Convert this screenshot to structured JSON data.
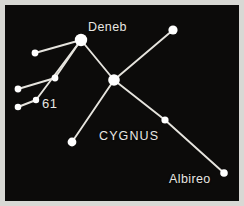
{
  "figure": {
    "kind": "star-chart",
    "subject": "CYGNUS",
    "background_color": "#0c0b0a",
    "border_color": "#d8d8d4",
    "star_color": "#ffffff",
    "line_color": "#e6e4de",
    "label_color": "#e9e7e2"
  },
  "labels": {
    "deneb": "Deneb",
    "sixty_one": "61",
    "cygnus": "CYGNUS",
    "albireo": "Albireo"
  },
  "chart_data": {
    "type": "scatter",
    "title": "CYGNUS",
    "xlabel": "",
    "ylabel": "",
    "xlim": [
      0,
      244
    ],
    "ylim": [
      0,
      206
    ],
    "grid": false,
    "legend": "none",
    "annotations": [
      "Deneb",
      "61",
      "CYGNUS",
      "Albireo"
    ],
    "stars": [
      {
        "id": "deneb",
        "label": "Deneb",
        "x": 81,
        "y": 40,
        "r": 6.2
      },
      {
        "id": "sadr",
        "label": "",
        "x": 114,
        "y": 80,
        "r": 5.8
      },
      {
        "id": "top-right",
        "label": "",
        "x": 173,
        "y": 30,
        "r": 4.6
      },
      {
        "id": "upper-left",
        "label": "",
        "x": 35,
        "y": 53,
        "r": 3.4
      },
      {
        "id": "wing-junction",
        "label": "",
        "x": 55,
        "y": 78,
        "r": 3.4
      },
      {
        "id": "left-mid",
        "label": "",
        "x": 18,
        "y": 89,
        "r": 3.4
      },
      {
        "id": "sixty-one",
        "label": "61",
        "x": 36,
        "y": 100,
        "r": 3.2
      },
      {
        "id": "lower-left",
        "label": "",
        "x": 18,
        "y": 107,
        "r": 3.3
      },
      {
        "id": "tail-bottom",
        "label": "",
        "x": 72,
        "y": 142,
        "r": 4.4
      },
      {
        "id": "mid-right",
        "label": "",
        "x": 165,
        "y": 120,
        "r": 3.6
      },
      {
        "id": "albireo",
        "label": "Albireo",
        "x": 224,
        "y": 173,
        "r": 3.8
      }
    ],
    "lines": [
      {
        "from": "upper-left",
        "to": "deneb"
      },
      {
        "from": "left-mid",
        "to": "wing-junction"
      },
      {
        "from": "wing-junction",
        "to": "deneb"
      },
      {
        "from": "lower-left",
        "to": "sixty-one"
      },
      {
        "from": "sixty-one",
        "to": "deneb"
      },
      {
        "from": "deneb",
        "to": "sadr"
      },
      {
        "from": "sadr",
        "to": "top-right"
      },
      {
        "from": "sadr",
        "to": "tail-bottom"
      },
      {
        "from": "sadr",
        "to": "mid-right"
      },
      {
        "from": "mid-right",
        "to": "albireo"
      }
    ]
  }
}
